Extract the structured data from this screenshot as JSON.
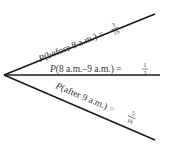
{
  "diagram": {
    "type": "tree-diagram",
    "branches": [
      {
        "event": "before 8 a.m.",
        "label_prefix": "P",
        "label_body": "(before 8 a.m.) =",
        "numerator": "3",
        "denominator": "16",
        "probability": 0.1875
      },
      {
        "event": "8 a.m.–9 a.m.",
        "label_prefix": "P",
        "label_body": "(8 a.m.–9 a.m.) =",
        "numerator": "1",
        "denominator": "2",
        "probability": 0.5
      },
      {
        "event": "after 9 a.m.",
        "label_prefix": "P",
        "label_body": "(after 9 a.m.) =",
        "numerator": "5",
        "denominator": "16",
        "probability": 0.3125
      }
    ],
    "line_color": "#1a1a1a",
    "text_color": "#333333"
  }
}
